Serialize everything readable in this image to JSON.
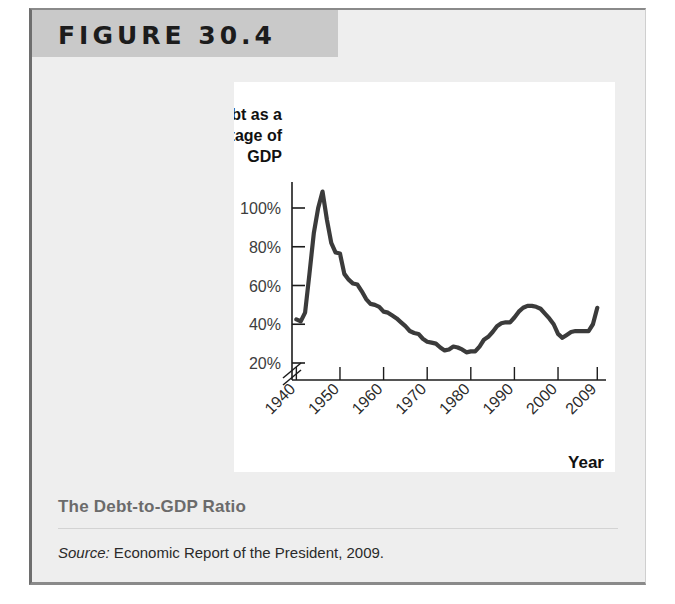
{
  "figure": {
    "banner_label": "FIGURE 30.4",
    "caption_title": "The Debt-to-GDP Ratio",
    "source_prefix": "Source:",
    "source_text": " Economic Report of the President, 2009."
  },
  "colors": {
    "banner_bg": "#c9c9c9",
    "card_bg": "#eeeeee",
    "panel_bg": "#ffffff",
    "line": "#3b3b3b",
    "axis": "#1c1c1c",
    "caption_title": "#6b6b6b"
  },
  "chart_data": {
    "type": "line",
    "title": "",
    "ylabel": "Debt as a percentage of GDP",
    "xlabel": "Year",
    "ylim": [
      16,
      115
    ],
    "xlim": [
      1939,
      2011
    ],
    "y_ticks": [
      20,
      40,
      60,
      80,
      100
    ],
    "y_tick_labels": [
      "20%",
      "40%",
      "60%",
      "80%",
      "100%"
    ],
    "x_ticks": [
      1940,
      1950,
      1960,
      1970,
      1980,
      1990,
      2000,
      2009
    ],
    "x_tick_labels": [
      "1940",
      "1950",
      "1960",
      "1970",
      "1980",
      "1990",
      "2000",
      "2009"
    ],
    "axis_break": true,
    "grid": false,
    "legend": "none",
    "series": [
      {
        "name": "Debt as a percentage of GDP",
        "x": [
          1940,
          1941,
          1942,
          1943,
          1944,
          1945,
          1946,
          1947,
          1948,
          1949,
          1950,
          1951,
          1952,
          1953,
          1954,
          1955,
          1956,
          1957,
          1958,
          1959,
          1960,
          1961,
          1962,
          1963,
          1964,
          1965,
          1966,
          1967,
          1968,
          1969,
          1970,
          1971,
          1972,
          1973,
          1974,
          1975,
          1976,
          1977,
          1978,
          1979,
          1980,
          1981,
          1982,
          1983,
          1984,
          1985,
          1986,
          1987,
          1988,
          1989,
          1990,
          1991,
          1992,
          1993,
          1994,
          1995,
          1996,
          1997,
          1998,
          1999,
          2000,
          2001,
          2002,
          2003,
          2004,
          2005,
          2006,
          2007,
          2008,
          2009
        ],
        "values": [
          42.5,
          41.5,
          46.0,
          66.0,
          87.0,
          100.0,
          108.5,
          94.0,
          82.0,
          77.0,
          76.5,
          66.0,
          63.0,
          61.0,
          60.5,
          57.0,
          53.0,
          50.5,
          50.0,
          49.0,
          46.5,
          46.0,
          44.5,
          43.0,
          41.0,
          39.0,
          36.5,
          35.5,
          35.0,
          32.5,
          31.0,
          30.5,
          30.0,
          28.0,
          26.5,
          27.0,
          28.5,
          28.0,
          27.0,
          25.5,
          26.0,
          26.0,
          28.5,
          32.0,
          33.5,
          36.0,
          39.0,
          40.5,
          41.0,
          41.0,
          43.5,
          46.5,
          48.5,
          49.5,
          49.5,
          49.0,
          48.0,
          45.5,
          43.0,
          40.0,
          35.0,
          33.0,
          34.5,
          36.0,
          36.5,
          36.5,
          36.5,
          36.5,
          40.0,
          48.5
        ]
      }
    ]
  }
}
